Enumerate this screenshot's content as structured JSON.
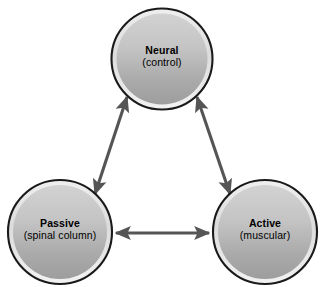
{
  "diagram": {
    "type": "triad-relationship-diagram",
    "background_color": "#ffffff",
    "node_outline_color": "#1a1a1a",
    "node_fill_top_color": "#cdcdcd",
    "node_fill_bottom_color": "#a3a3a3",
    "node_highlight_color": "#e6e6e6",
    "arrow_color": "#555555",
    "label_color": "#000000",
    "nodes": [
      {
        "id": "neural",
        "title": "Neural",
        "subtitle": "(control)",
        "cx": 162,
        "cy": 59,
        "r": 50
      },
      {
        "id": "passive",
        "title": "Passive",
        "subtitle": "(spinal column)",
        "cx": 60,
        "cy": 232,
        "r": 52
      },
      {
        "id": "active",
        "title": "Active",
        "subtitle": "(muscular)",
        "cx": 265,
        "cy": 232,
        "r": 52
      }
    ],
    "connectors": [
      {
        "id": "passive-neural",
        "from": "passive",
        "to": "neural",
        "style": "double-headed-arrow"
      },
      {
        "id": "neural-active",
        "from": "neural",
        "to": "active",
        "style": "double-headed-arrow"
      },
      {
        "id": "passive-active",
        "from": "passive",
        "to": "active",
        "style": "double-headed-arrow"
      }
    ]
  }
}
